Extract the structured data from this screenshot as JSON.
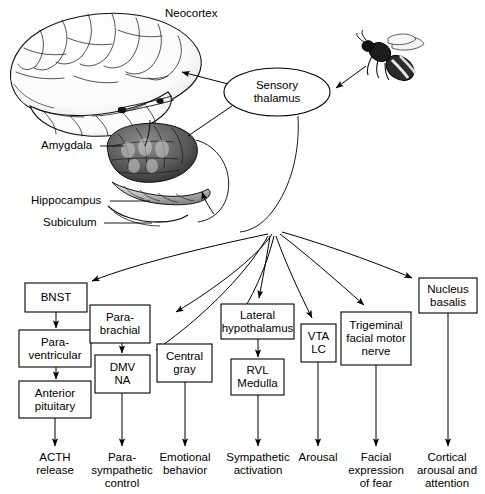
{
  "figure": {
    "background": "#ffffff",
    "ink": "#000000"
  },
  "anatomy_labels": [
    {
      "id": "neocortex",
      "text": "Neocortex",
      "x": 165,
      "y": 8,
      "leader": false
    },
    {
      "id": "amygdala",
      "text": "Amygdala",
      "x": 43,
      "y": 140,
      "leader": true
    },
    {
      "id": "hippocampus",
      "text": "Hippocampus",
      "x": 33,
      "y": 195,
      "leader": true
    },
    {
      "id": "subiculum",
      "text": "Subiculum",
      "x": 45,
      "y": 217,
      "leader": true
    }
  ],
  "nodes": {
    "sensory_thalamus": {
      "label": "Sensory\nthalamus",
      "shape": "ellipse",
      "cx": 277,
      "cy": 92,
      "rx": 53,
      "ry": 24
    },
    "bee": {
      "label": "bee-stimulus",
      "shape": "image",
      "x": 358,
      "y": 34,
      "w": 66,
      "h": 54
    }
  },
  "boxes": [
    {
      "id": "bnst",
      "text": "BNST",
      "x": 25,
      "y": 283,
      "w": 62,
      "h": 29
    },
    {
      "id": "paraventricular",
      "text": "Para-\nventricular",
      "x": 19,
      "y": 330,
      "w": 72,
      "h": 37
    },
    {
      "id": "anterior_pituitary",
      "text": "Anterior\npituitary",
      "x": 19,
      "y": 381,
      "w": 72,
      "h": 37
    },
    {
      "id": "parabrachial",
      "text": "Para-\nbrachial",
      "x": 90,
      "y": 305,
      "w": 60,
      "h": 38
    },
    {
      "id": "dmv_na",
      "text": "DMV\nNA",
      "x": 95,
      "y": 355,
      "w": 55,
      "h": 38
    },
    {
      "id": "central_gray",
      "text": "Central\ngray",
      "x": 157,
      "y": 344,
      "w": 55,
      "h": 38
    },
    {
      "id": "lateral_hypothalamus",
      "text": "Lateral\nhypothalamus",
      "x": 221,
      "y": 304,
      "w": 73,
      "h": 35
    },
    {
      "id": "rvl_medulla",
      "text": "RVL\nMedulla",
      "x": 231,
      "y": 359,
      "w": 53,
      "h": 36
    },
    {
      "id": "vta_lc",
      "text": "VTA\nLC",
      "x": 301,
      "y": 324,
      "w": 35,
      "h": 38
    },
    {
      "id": "trigeminal",
      "text": "Trigeminal\nfacial motor\nnerve",
      "x": 341,
      "y": 312,
      "w": 70,
      "h": 53
    },
    {
      "id": "nucleus_basalis",
      "text": "Nucleus\nbasalis",
      "x": 419,
      "y": 278,
      "w": 58,
      "h": 35
    }
  ],
  "outcomes": [
    {
      "id": "acth",
      "text": "ACTH\nrelease",
      "cx": 55,
      "y": 452,
      "arrow_x": 55,
      "arrow_from": 418,
      "arrow_to": 447
    },
    {
      "id": "parasymp",
      "text": "Para-\nsympathetic\ncontrol",
      "cx": 122,
      "y": 452,
      "arrow_x": 122,
      "arrow_from": 393,
      "arrow_to": 447
    },
    {
      "id": "emotional",
      "text": "Emotional\nbehavior",
      "cx": 185,
      "y": 452,
      "arrow_x": 185,
      "arrow_from": 382,
      "arrow_to": 447
    },
    {
      "id": "sympathetic",
      "text": "Sympathetic\nactivation",
      "cx": 258,
      "y": 452,
      "arrow_x": 258,
      "arrow_from": 395,
      "arrow_to": 447
    },
    {
      "id": "arousal",
      "text": "Arousal",
      "cx": 318,
      "y": 452,
      "arrow_x": 318,
      "arrow_from": 362,
      "arrow_to": 447
    },
    {
      "id": "facial",
      "text": "Facial\nexpression\nof fear",
      "cx": 376,
      "y": 452,
      "arrow_x": 376,
      "arrow_from": 365,
      "arrow_to": 447
    },
    {
      "id": "cortical",
      "text": "Cortical\narousal and\nattention",
      "cx": 448,
      "y": 452,
      "arrow_x": 448,
      "arrow_from": 313,
      "arrow_to": 447
    }
  ],
  "fan_origin": {
    "x": 270,
    "y": 232
  },
  "connections": [
    {
      "from": "bee",
      "to": "sensory_thalamus",
      "type": "straight-arrow"
    },
    {
      "from": "sensory_thalamus",
      "to": "neocortex",
      "type": "straight-arrow"
    },
    {
      "from": "sensory_thalamus",
      "to": "amygdala",
      "type": "straight-line"
    },
    {
      "from": "amygdala",
      "to": "bnst",
      "type": "fan-arrow"
    },
    {
      "from": "amygdala",
      "to": "parabrachial",
      "type": "fan-arrow"
    },
    {
      "from": "amygdala",
      "to": "dmv_na",
      "type": "fan-arrow"
    },
    {
      "from": "amygdala",
      "to": "central_gray",
      "type": "fan-arrow"
    },
    {
      "from": "amygdala",
      "to": "lateral_hypothalamus",
      "type": "fan-arrow"
    },
    {
      "from": "amygdala",
      "to": "vta_lc",
      "type": "fan-arrow"
    },
    {
      "from": "amygdala",
      "to": "trigeminal",
      "type": "fan-arrow"
    },
    {
      "from": "amygdala",
      "to": "nucleus_basalis",
      "type": "fan-arrow"
    },
    {
      "from": "bnst",
      "to": "paraventricular",
      "type": "vertical-arrow"
    },
    {
      "from": "paraventricular",
      "to": "anterior_pituitary",
      "type": "vertical-arrow"
    },
    {
      "from": "parabrachial",
      "to": "dmv_na",
      "type": "vertical-arrow"
    },
    {
      "from": "lateral_hypothalamus",
      "to": "rvl_medulla",
      "type": "vertical-arrow"
    }
  ]
}
